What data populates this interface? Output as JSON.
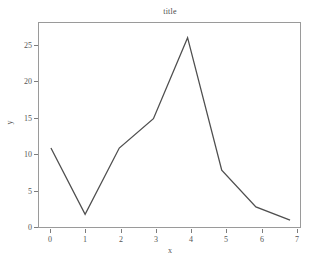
{
  "chart_data": {
    "type": "line",
    "title": "title",
    "xlabel": "x",
    "ylabel": "y",
    "x": [
      0,
      1,
      2,
      3,
      4,
      5,
      6,
      7
    ],
    "values": [
      11,
      2,
      11,
      15,
      26,
      8,
      3,
      1.2
    ],
    "series": [
      {
        "name": "y",
        "values": [
          11,
          2,
          11,
          15,
          26,
          8,
          3,
          1.2
        ]
      }
    ],
    "xlim": [
      -0.35,
      7.35
    ],
    "ylim": [
      0,
      28
    ],
    "xticks": [
      0,
      1,
      2,
      3,
      4,
      5,
      6,
      7
    ],
    "xtick_labels": [
      "0",
      "1",
      "2",
      "3",
      "4",
      "5",
      "6",
      "7"
    ],
    "yticks": [
      0,
      5,
      10,
      15,
      20,
      25
    ],
    "ytick_labels": [
      "0",
      "5",
      "10",
      "15",
      "20",
      "25"
    ],
    "grid": false,
    "legend": "none",
    "line_color": "#4f4f4f",
    "frame_color": "#9a9a9a",
    "background_color": "#ffffff"
  }
}
